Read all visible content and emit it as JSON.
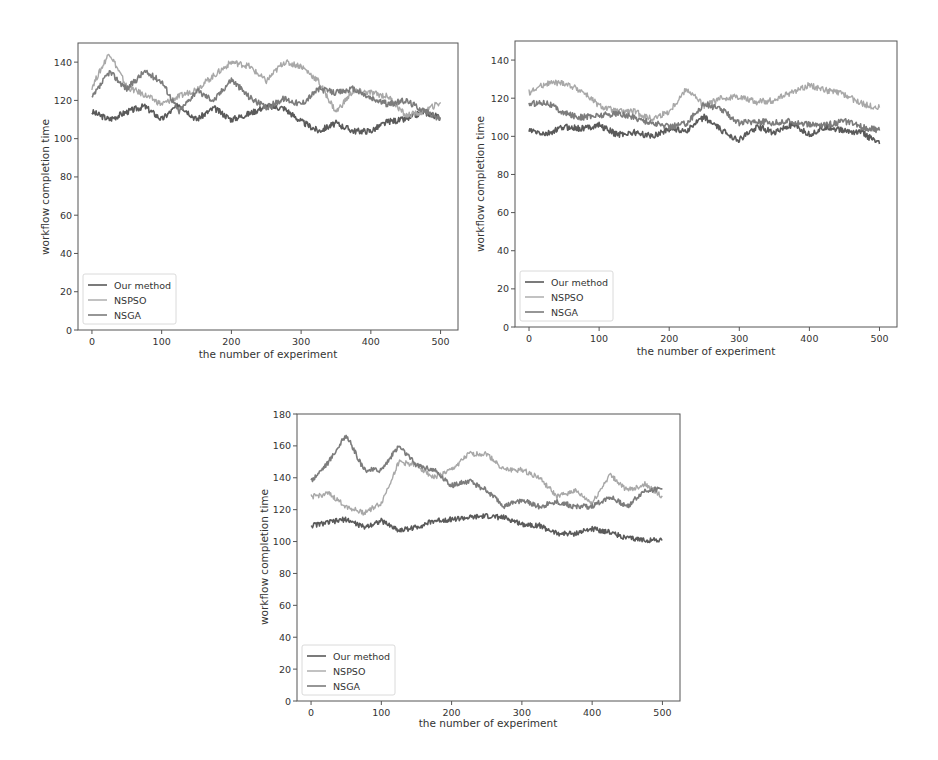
{
  "colors": {
    "our_method": "#5a5a5a",
    "nspso": "#a8a8a8",
    "nsga": "#7c7c7c",
    "axis": "#555555"
  },
  "chart_data": [
    {
      "type": "line",
      "title": "",
      "xlabel": "the number of experiment",
      "ylabel": "workflow completion time",
      "xlim": [
        -20,
        525
      ],
      "ylim": [
        0,
        150
      ],
      "xticks": [
        0,
        100,
        200,
        300,
        400,
        500
      ],
      "yticks": [
        0,
        20,
        40,
        60,
        80,
        100,
        120,
        140
      ],
      "grid": false,
      "legend_position": "lower left",
      "x": [
        0,
        25,
        50,
        75,
        100,
        125,
        150,
        175,
        200,
        225,
        250,
        275,
        300,
        325,
        350,
        375,
        400,
        425,
        450,
        475,
        500
      ],
      "series": [
        {
          "name": "Our method",
          "values": [
            114,
            110,
            114,
            117,
            110,
            118,
            110,
            116,
            110,
            113,
            117,
            116,
            109,
            104,
            108,
            104,
            104,
            109,
            110,
            114,
            111
          ]
        },
        {
          "name": "NSPSO",
          "values": [
            127,
            145,
            127,
            123,
            118,
            122,
            126,
            133,
            140,
            138,
            130,
            140,
            138,
            130,
            114,
            125,
            124,
            122,
            112,
            114,
            119
          ]
        },
        {
          "name": "NSGA",
          "values": [
            121,
            135,
            126,
            135,
            130,
            114,
            125,
            120,
            131,
            122,
            116,
            121,
            118,
            126,
            124,
            126,
            121,
            118,
            120,
            115,
            110
          ]
        }
      ]
    },
    {
      "type": "line",
      "title": "",
      "xlabel": "the number of experiment",
      "ylabel": "workflow completion time",
      "xlim": [
        -20,
        525
      ],
      "ylim": [
        0,
        150
      ],
      "xticks": [
        0,
        100,
        200,
        300,
        400,
        500
      ],
      "yticks": [
        0,
        20,
        40,
        60,
        80,
        100,
        120,
        140
      ],
      "grid": false,
      "legend_position": "lower left",
      "x": [
        0,
        25,
        50,
        75,
        100,
        125,
        150,
        175,
        200,
        225,
        250,
        275,
        300,
        325,
        350,
        375,
        400,
        425,
        450,
        475,
        500
      ],
      "series": [
        {
          "name": "Our method",
          "values": [
            103,
            101,
            105,
            104,
            106,
            101,
            102,
            100,
            104,
            103,
            110,
            103,
            98,
            105,
            102,
            106,
            101,
            105,
            103,
            102,
            96
          ]
        },
        {
          "name": "NSPSO",
          "values": [
            123,
            128,
            128,
            124,
            116,
            113,
            113,
            109,
            113,
            125,
            116,
            120,
            121,
            118,
            119,
            123,
            127,
            124,
            122,
            117,
            115
          ]
        },
        {
          "name": "NSGA",
          "values": [
            117,
            118,
            112,
            110,
            111,
            112,
            110,
            107,
            105,
            107,
            117,
            114,
            107,
            108,
            107,
            108,
            106,
            106,
            108,
            105,
            103
          ]
        }
      ]
    },
    {
      "type": "line",
      "title": "",
      "xlabel": "the number of experiment",
      "ylabel": "workflow completion time",
      "xlim": [
        -20,
        525
      ],
      "ylim": [
        0,
        180
      ],
      "xticks": [
        0,
        100,
        200,
        300,
        400,
        500
      ],
      "yticks": [
        0,
        20,
        40,
        60,
        80,
        100,
        120,
        140,
        160,
        180
      ],
      "grid": false,
      "legend_position": "lower left",
      "x": [
        0,
        25,
        50,
        75,
        100,
        125,
        150,
        175,
        200,
        225,
        250,
        275,
        300,
        325,
        350,
        375,
        400,
        425,
        450,
        475,
        500
      ],
      "series": [
        {
          "name": "Our method",
          "values": [
            110,
            112,
            114,
            109,
            113,
            107,
            109,
            113,
            114,
            115,
            116,
            115,
            111,
            110,
            105,
            105,
            108,
            106,
            102,
            101,
            101
          ]
        },
        {
          "name": "NSPSO",
          "values": [
            128,
            130,
            122,
            118,
            124,
            150,
            148,
            140,
            145,
            155,
            155,
            145,
            145,
            140,
            128,
            132,
            124,
            142,
            132,
            136,
            128
          ]
        },
        {
          "name": "NSGA",
          "values": [
            138,
            150,
            167,
            145,
            145,
            160,
            148,
            145,
            135,
            138,
            132,
            122,
            126,
            122,
            125,
            122,
            122,
            128,
            122,
            132,
            133
          ]
        }
      ]
    }
  ],
  "charts": [
    {
      "xlabel": "the number of experiment",
      "ylabel": "workflow completion time",
      "legend": [
        "Our method",
        "NSPSO",
        "NSGA"
      ]
    },
    {
      "xlabel": "the number of experiment",
      "ylabel": "workflow completion time",
      "legend": [
        "Our method",
        "NSPSO",
        "NSGA"
      ]
    },
    {
      "xlabel": "the number of experiment",
      "ylabel": "workflow completion time",
      "legend": [
        "Our method",
        "NSPSO",
        "NSGA"
      ]
    }
  ]
}
